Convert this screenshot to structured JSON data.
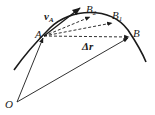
{
  "diagram": {
    "title": "",
    "points": {
      "O": {
        "label": "O",
        "x": 17,
        "y": 102
      },
      "A": {
        "label": "A",
        "x": 44,
        "y": 36
      },
      "B": {
        "label": "B",
        "x": 130,
        "y": 37
      },
      "B1": {
        "label": "B",
        "sub": "1",
        "x": 113,
        "y": 22
      },
      "B2": {
        "label": "B",
        "sub": "2",
        "x": 89,
        "y": 16
      }
    },
    "labels": {
      "O": "O",
      "A": "A",
      "B": "B",
      "B1_main": "B",
      "B1_sub": "1",
      "B2_main": "B",
      "B2_sub": "2",
      "vA_main": "v",
      "vA_sub": "A",
      "delta_r": "Δr"
    },
    "colors": {
      "ink": "#1a1a1a",
      "background": "#ffffff"
    }
  }
}
